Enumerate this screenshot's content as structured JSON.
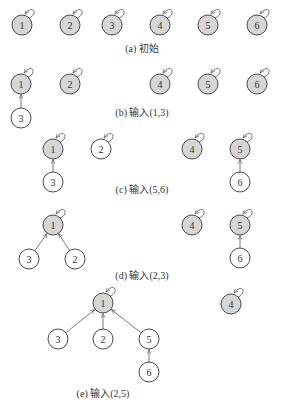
{
  "diagram": {
    "style": {
      "root_fill": "#d6d6d6",
      "child_fill": "#ffffff",
      "stroke": "#4a4a4a"
    },
    "panels": [
      {
        "id": "a",
        "caption": "(a) 初始",
        "caption_pos": [
          142,
          52
        ],
        "nodes": [
          {
            "id": "1",
            "x": 22,
            "y": 25,
            "root": true
          },
          {
            "id": "2",
            "x": 70,
            "y": 25,
            "root": true
          },
          {
            "id": "3",
            "x": 112,
            "y": 25,
            "root": true
          },
          {
            "id": "4",
            "x": 160,
            "y": 25,
            "root": true
          },
          {
            "id": "5",
            "x": 208,
            "y": 25,
            "root": true
          },
          {
            "id": "6",
            "x": 257,
            "y": 25,
            "root": true
          }
        ],
        "edges": []
      },
      {
        "id": "b",
        "caption": "(b) 输入(1,3)",
        "caption_pos": [
          142,
          116
        ],
        "nodes": [
          {
            "id": "1",
            "x": 21,
            "y": 84,
            "root": true
          },
          {
            "id": "2",
            "x": 70,
            "y": 84,
            "root": true
          },
          {
            "id": "4",
            "x": 160,
            "y": 84,
            "root": true
          },
          {
            "id": "5",
            "x": 208,
            "y": 84,
            "root": true
          },
          {
            "id": "6",
            "x": 257,
            "y": 84,
            "root": true
          },
          {
            "id": "3",
            "x": 21,
            "y": 118,
            "root": false
          }
        ],
        "edges": [
          {
            "from": "3",
            "to": "1"
          }
        ]
      },
      {
        "id": "c",
        "caption": "(c) 输入(5,6)",
        "caption_pos": [
          142,
          193
        ],
        "nodes": [
          {
            "id": "1",
            "x": 53,
            "y": 149,
            "root": true
          },
          {
            "id": "2",
            "x": 101,
            "y": 149,
            "root": false
          },
          {
            "id": "4",
            "x": 192,
            "y": 149,
            "root": true
          },
          {
            "id": "5",
            "x": 240,
            "y": 149,
            "root": true
          },
          {
            "id": "3",
            "x": 53,
            "y": 182,
            "root": false
          },
          {
            "id": "6",
            "x": 240,
            "y": 182,
            "root": false
          }
        ],
        "edges": [
          {
            "from": "3",
            "to": "1"
          },
          {
            "from": "6",
            "to": "5"
          }
        ],
        "self_loops": [
          "1",
          "2",
          "4",
          "5"
        ]
      },
      {
        "id": "d",
        "caption": "(d) 输入(2,3)",
        "caption_pos": [
          142,
          279
        ],
        "nodes": [
          {
            "id": "1",
            "x": 53,
            "y": 225,
            "root": true
          },
          {
            "id": "4",
            "x": 192,
            "y": 225,
            "root": true
          },
          {
            "id": "5",
            "x": 240,
            "y": 225,
            "root": true
          },
          {
            "id": "3",
            "x": 29,
            "y": 259,
            "root": false
          },
          {
            "id": "2",
            "x": 75,
            "y": 259,
            "root": false
          },
          {
            "id": "6",
            "x": 240,
            "y": 258,
            "root": false
          }
        ],
        "edges": [
          {
            "from": "3",
            "to": "1"
          },
          {
            "from": "2",
            "to": "1"
          },
          {
            "from": "6",
            "to": "5"
          }
        ]
      },
      {
        "id": "e",
        "caption": "(e) 输入(2,5)",
        "caption_pos": [
          103,
          397
        ],
        "nodes": [
          {
            "id": "1",
            "x": 103,
            "y": 303,
            "root": true
          },
          {
            "id": "4",
            "x": 231,
            "y": 304,
            "root": true
          },
          {
            "id": "3",
            "x": 58,
            "y": 339,
            "root": false
          },
          {
            "id": "2",
            "x": 103,
            "y": 339,
            "root": false
          },
          {
            "id": "5",
            "x": 149,
            "y": 339,
            "root": false
          },
          {
            "id": "6",
            "x": 149,
            "y": 372,
            "root": false
          }
        ],
        "edges": [
          {
            "from": "3",
            "to": "1"
          },
          {
            "from": "2",
            "to": "1"
          },
          {
            "from": "5",
            "to": "1"
          },
          {
            "from": "6",
            "to": "5"
          }
        ]
      }
    ]
  }
}
